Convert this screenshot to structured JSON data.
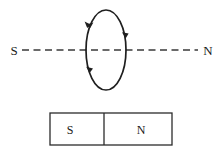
{
  "figure": {
    "background_color": "#ffffff",
    "ink_color": "#1f1f1f",
    "width": 223,
    "height": 154
  },
  "axis": {
    "name": "magnetic-axis",
    "style": "dashed",
    "left_label": "S",
    "right_label": "N",
    "y": 50,
    "x_start": 22,
    "x_end": 198,
    "dash_pattern": "7 4.5"
  },
  "loop": {
    "name": "current-loop",
    "shape": "ellipse",
    "center_x": 106,
    "center_y": 50,
    "radius_x": 20,
    "radius_y": 40,
    "circulation": "clockwise-viewed-from-left",
    "arrow_count": 4,
    "arrows": [
      {
        "position": "top-left",
        "direction": "down-left"
      },
      {
        "position": "right-upper",
        "direction": "down"
      },
      {
        "position": "bottom-left",
        "direction": "down-right"
      },
      {
        "position": "left-lower",
        "direction": "down"
      }
    ]
  },
  "magnet": {
    "name": "bar-magnet",
    "x": 50,
    "y": 113,
    "width": 122,
    "height": 32,
    "divider_x": 104,
    "south_label": "S",
    "north_label": "N",
    "south_label_x": 70,
    "north_label_x": 141,
    "label_y": 134
  }
}
